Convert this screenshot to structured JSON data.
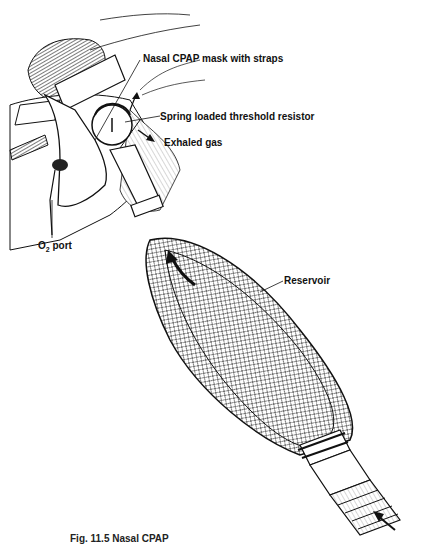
{
  "figure": {
    "caption_visible": "Fig. 11.5 Nasal CPAP"
  },
  "labels": {
    "mask": "Nasal CPAP mask with straps",
    "resistor": "Spring loaded threshold resistor",
    "exhaled": "Exhaled gas",
    "o2_prefix": "O",
    "o2_sub": "2",
    "o2_suffix": " port",
    "reservoir": "Reservoir"
  },
  "colors": {
    "ink": "#111111",
    "background": "#ffffff",
    "hatch": "#555555"
  }
}
